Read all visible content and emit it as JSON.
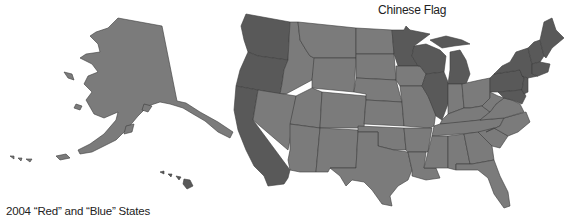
{
  "labels": {
    "top": "Chinese Flag",
    "bottom": "2004 “Red” and “Blue” States"
  },
  "legend_colors": {
    "red_states": "#7b7b7b",
    "blue_states": "#595959",
    "border": "#3c3c3c",
    "background": "#ffffff"
  },
  "map": {
    "region": "United States",
    "blue_states": [
      "WA",
      "OR",
      "CA",
      "NV-no",
      "MN",
      "WI",
      "MI",
      "IL",
      "PA",
      "NY",
      "NJ",
      "MD",
      "DE",
      "CT",
      "RI",
      "MA",
      "VT",
      "NH",
      "ME",
      "HI"
    ],
    "red_states_note": "All other states including AK shown in lighter gray"
  }
}
